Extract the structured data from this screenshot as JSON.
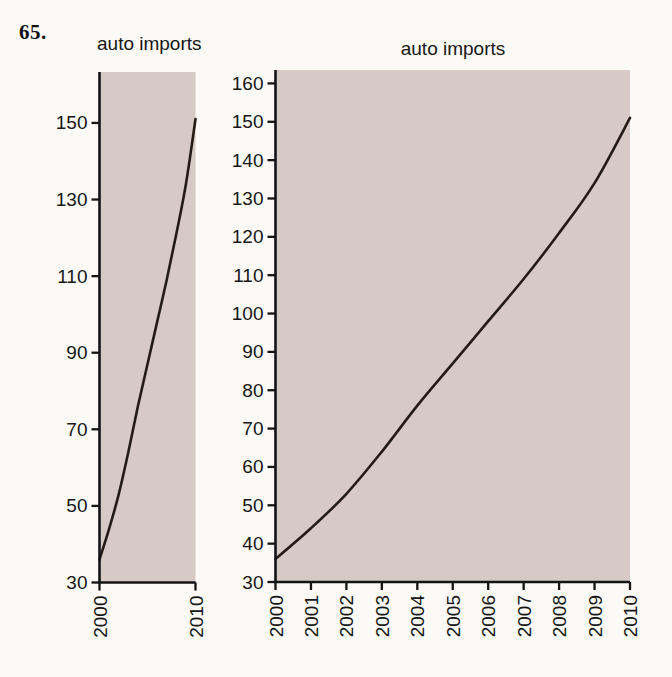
{
  "problem_number": "65.",
  "colors": {
    "page_background": "#fcfaf6",
    "plot_background": "#d6c9c6",
    "series_line": "#241b16",
    "axis": "#141414",
    "label_text": "#161616"
  },
  "chart_data": [
    {
      "id": "left",
      "type": "line",
      "title": "auto imports",
      "x": [
        2000,
        2001,
        2002,
        2003,
        2004,
        2005,
        2006,
        2007,
        2008,
        2009,
        2010
      ],
      "values": [
        36,
        44,
        53,
        64,
        76,
        87,
        98,
        109,
        121,
        134,
        151
      ],
      "xlim": [
        2000,
        2010
      ],
      "ylim": [
        30,
        163.3
      ],
      "yticks": [
        30,
        50,
        70,
        90,
        110,
        130,
        150
      ],
      "xticks": [
        2000,
        2010
      ],
      "x_tick_label_rotation": -90,
      "grid": false,
      "legend": "none"
    },
    {
      "id": "right",
      "type": "line",
      "title": "auto imports",
      "x": [
        2000,
        2001,
        2002,
        2003,
        2004,
        2005,
        2006,
        2007,
        2008,
        2009,
        2010
      ],
      "values": [
        36,
        44,
        53,
        64,
        76,
        87,
        98,
        109,
        121,
        134,
        151
      ],
      "xlim": [
        2000,
        2010
      ],
      "ylim": [
        30,
        163.5
      ],
      "yticks": [
        30,
        40,
        50,
        60,
        70,
        80,
        90,
        100,
        110,
        120,
        130,
        140,
        150,
        160
      ],
      "xticks": [
        2000,
        2001,
        2002,
        2003,
        2004,
        2005,
        2006,
        2007,
        2008,
        2009,
        2010
      ],
      "x_tick_label_rotation": -90,
      "grid": false,
      "legend": "none"
    }
  ]
}
